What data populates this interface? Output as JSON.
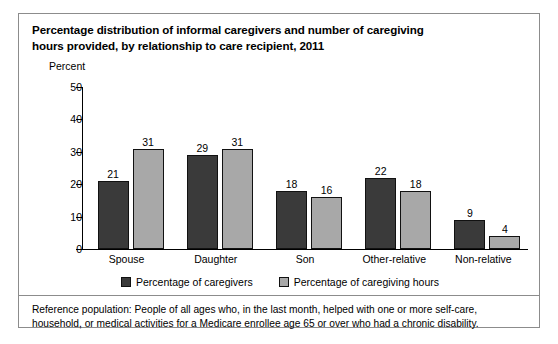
{
  "figure": {
    "title_lines": [
      "Percentage distribution of informal caregivers and number of caregiving",
      "hours provided, by relationship to care recipient, 2011"
    ],
    "note_lines": [
      "Reference population: People of all ages who, in the last month, helped with one or more self-care,",
      "household, or medical activities for a Medicare enrollee age 65 or over who had a chronic disability."
    ],
    "colors": {
      "series_caregivers": "#3a3a3a",
      "series_hours": "#a8a8a8",
      "axis": "#000000",
      "frame": "#8c8c8c",
      "background": "#ffffff"
    }
  },
  "chart_data": {
    "type": "bar",
    "title": "Percentage distribution of informal caregivers and number of caregiving hours provided, by relationship to care recipient, 2011",
    "xlabel": "",
    "ylabel": "Percent",
    "ylim": [
      0,
      50
    ],
    "yticks": [
      0,
      10,
      20,
      30,
      40,
      50
    ],
    "ytick_labels": [
      "0",
      "10",
      "20",
      "30",
      "40",
      "50"
    ],
    "grid": false,
    "legend_position": "bottom-center",
    "categories": [
      "Spouse",
      "Daughter",
      "Son",
      "Other-relative",
      "Non-relative"
    ],
    "series": [
      {
        "name": "Percentage of caregivers",
        "color": "#3a3a3a",
        "values": [
          21,
          29,
          18,
          22,
          9
        ],
        "labels": [
          "21",
          "29",
          "18",
          "22",
          "9"
        ]
      },
      {
        "name": "Percentage of caregiving hours",
        "color": "#a8a8a8",
        "values": [
          31,
          31,
          16,
          18,
          4
        ],
        "labels": [
          "31",
          "31",
          "16",
          "18",
          "4"
        ]
      }
    ]
  }
}
